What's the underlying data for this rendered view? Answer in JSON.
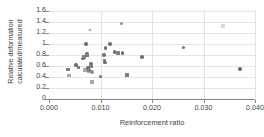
{
  "chart_data": {
    "type": "scatter",
    "title": "",
    "xlabel": "Reinforcement ratio",
    "ylabel_lines": [
      "Relative deformation",
      "calculated/measured"
    ],
    "ylabel": "Relative deformation calculated/measured",
    "xlim": [
      0.0,
      0.04
    ],
    "ylim": [
      0,
      1.6
    ],
    "xticks": [
      0.0,
      0.01,
      0.02,
      0.03,
      0.04
    ],
    "xtick_labels": [
      "0.000",
      "0.010",
      "0.020",
      "0.030",
      "0.040"
    ],
    "yticks": [
      0,
      0.2,
      0.4,
      0.6,
      0.8,
      1.0,
      1.2,
      1.4,
      1.6
    ],
    "ytick_labels": [
      "0",
      "0.2",
      "0.4",
      "0.6",
      "0.8",
      "1",
      "1.2",
      "1.4",
      "1.6"
    ],
    "grid": "horizontal-and-vertical",
    "legend": "none",
    "marker_colors": {
      "square": "#808080",
      "square_light": "#a8a8a8",
      "circle": "#707070",
      "circle_light": "#909090",
      "triangle": "#b4b4b4",
      "faint": "#d8d8d8"
    },
    "gridline_color": "#e4e4e4",
    "axis_color": "#868686",
    "text_color": "#3f3f3f",
    "points": [
      {
        "x": 0.0037,
        "y": 0.54,
        "m": "sq"
      },
      {
        "x": 0.0039,
        "y": 0.43,
        "m": "sq2"
      },
      {
        "x": 0.0052,
        "y": 0.62,
        "m": "ci"
      },
      {
        "x": 0.0057,
        "y": 0.57,
        "m": "sq"
      },
      {
        "x": 0.0066,
        "y": 0.74,
        "m": "ci"
      },
      {
        "x": 0.0068,
        "y": 0.76,
        "m": "sq"
      },
      {
        "x": 0.007,
        "y": 0.53,
        "m": "sq2"
      },
      {
        "x": 0.0072,
        "y": 1.0,
        "m": "ci"
      },
      {
        "x": 0.0074,
        "y": 0.82,
        "m": "ci"
      },
      {
        "x": 0.0075,
        "y": 0.79,
        "m": "sq"
      },
      {
        "x": 0.0076,
        "y": 0.56,
        "m": "ci"
      },
      {
        "x": 0.0077,
        "y": 0.5,
        "m": "sq2"
      },
      {
        "x": 0.0078,
        "y": 0.52,
        "m": "sq"
      },
      {
        "x": 0.0079,
        "y": 1.26,
        "m": "tri"
      },
      {
        "x": 0.0081,
        "y": 0.64,
        "m": "ci"
      },
      {
        "x": 0.0082,
        "y": 0.6,
        "m": "sq"
      },
      {
        "x": 0.0083,
        "y": 0.49,
        "m": "ci2"
      },
      {
        "x": 0.0084,
        "y": 0.31,
        "m": "sq2"
      },
      {
        "x": 0.01,
        "y": 0.41,
        "m": "ci"
      },
      {
        "x": 0.0107,
        "y": 0.8,
        "m": "ci"
      },
      {
        "x": 0.0108,
        "y": 0.7,
        "m": "sq"
      },
      {
        "x": 0.0109,
        "y": 0.66,
        "m": "ci"
      },
      {
        "x": 0.011,
        "y": 0.93,
        "m": "ci"
      },
      {
        "x": 0.0119,
        "y": 1.0,
        "m": "ci"
      },
      {
        "x": 0.0127,
        "y": 0.85,
        "m": "ci"
      },
      {
        "x": 0.0134,
        "y": 0.84,
        "m": "sq"
      },
      {
        "x": 0.0141,
        "y": 1.37,
        "m": "ci2"
      },
      {
        "x": 0.0143,
        "y": 0.84,
        "m": "ci"
      },
      {
        "x": 0.0152,
        "y": 0.44,
        "m": "sq"
      },
      {
        "x": 0.0181,
        "y": 0.76,
        "m": "ci"
      },
      {
        "x": 0.0261,
        "y": 0.94,
        "m": "ci"
      },
      {
        "x": 0.0338,
        "y": 1.33,
        "m": "faint"
      },
      {
        "x": 0.0371,
        "y": 0.55,
        "m": "ci"
      }
    ]
  }
}
